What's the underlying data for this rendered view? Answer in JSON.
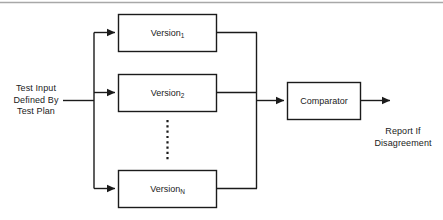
{
  "diagram": {
    "type": "block-diagram",
    "colors": {
      "stroke": "#1b1b1b",
      "box_fill": "#ffffff",
      "text": "#1b1b1b",
      "top_rule": "#a8a8a8",
      "background": "#ffffff"
    },
    "input_label": {
      "line1": "Test Input",
      "line2": "Defined By",
      "line3": "Test Plan"
    },
    "version_boxes": [
      {
        "name": "Version",
        "subscript": "1"
      },
      {
        "name": "Version",
        "subscript": "2"
      },
      {
        "name": "Version",
        "subscript": "N"
      }
    ],
    "ellipsis": "vertical-dotted-ellipsis",
    "comparator": {
      "label": "Comparator"
    },
    "output_label": {
      "line1": "Report If",
      "line2": "Disagreement"
    },
    "icons": {
      "arrowhead": "arrowhead-icon",
      "fan_out_bus": "fan-out-bus-icon",
      "merge_bus": "merge-bus-icon"
    }
  }
}
